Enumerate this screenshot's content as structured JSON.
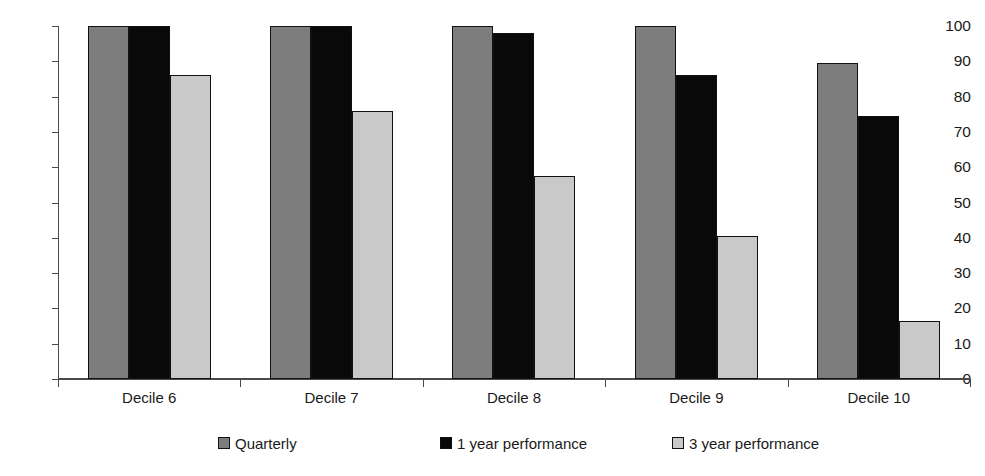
{
  "chart_data": {
    "type": "bar",
    "title": "",
    "xlabel": "",
    "ylabel": "",
    "ylim": [
      0,
      100
    ],
    "yticks": [
      0,
      10,
      20,
      30,
      40,
      50,
      60,
      70,
      80,
      90,
      100
    ],
    "grid": false,
    "legend_position": "bottom",
    "categories": [
      "Decile 6",
      "Decile 7",
      "Decile 8",
      "Decile 9",
      "Decile 10"
    ],
    "series": [
      {
        "name": "Quarterly",
        "color": "#7d7d7d",
        "values": [
          100,
          100,
          100,
          100,
          89.5
        ]
      },
      {
        "name": "1 year performance",
        "color": "#090909",
        "values": [
          100,
          100,
          98,
          86,
          74.5
        ]
      },
      {
        "name": "3 year performance",
        "color": "#c9c9c9",
        "values": [
          86,
          76,
          57.5,
          40.5,
          16.5
        ]
      }
    ]
  },
  "axis": {
    "y_tick_labels": [
      "100",
      "90",
      "80",
      "70",
      "60",
      "50",
      "40",
      "30",
      "20",
      "10",
      "0"
    ]
  },
  "legend": {
    "items": [
      {
        "label": "Quarterly",
        "swatch": "quarterly-swatch"
      },
      {
        "label": "1 year performance",
        "swatch": "one-year-swatch"
      },
      {
        "label": "3 year performance",
        "swatch": "three-year-swatch"
      }
    ]
  }
}
